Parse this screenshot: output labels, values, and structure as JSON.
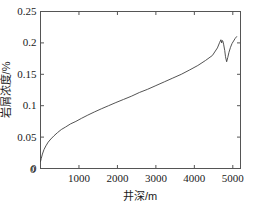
{
  "chart_data": {
    "type": "line",
    "title": "",
    "xlabel": "井深/m",
    "ylabel": "岩屑浓度/%",
    "xlim": [
      0,
      5200
    ],
    "ylim": [
      0,
      0.25
    ],
    "xticks": [
      0,
      1000,
      2000,
      3000,
      4000,
      5000
    ],
    "xtick_labels": [
      "0",
      "1000",
      "2000",
      "3000",
      "4000",
      "5000"
    ],
    "yticks": [
      0,
      0.05,
      0.1,
      0.15,
      0.2,
      0.25
    ],
    "ytick_labels": [
      "0",
      "0.05",
      "0.1",
      "0.15",
      "0.2",
      "0.25"
    ],
    "grid": false,
    "legend": null,
    "line_color": "#404040",
    "line_width": 0.9,
    "axes_color": "#555555",
    "background_color": "#ffffff",
    "tick_direction": "in",
    "series": [
      {
        "name": "岩屑浓度",
        "x": [
          0,
          20,
          50,
          90,
          140,
          200,
          270,
          350,
          440,
          540,
          650,
          780,
          920,
          1070,
          1230,
          1400,
          1580,
          1770,
          1960,
          2160,
          2360,
          2570,
          2780,
          3000,
          3220,
          3440,
          3660,
          3880,
          4090,
          4290,
          4470,
          4600,
          4660,
          4690,
          4710,
          4720,
          4740,
          4760,
          4790,
          4810,
          4840,
          4870,
          4900,
          4940,
          4980,
          5020,
          5060,
          5100
        ],
        "y": [
          0.011,
          0.016,
          0.023,
          0.03,
          0.036,
          0.042,
          0.047,
          0.052,
          0.057,
          0.062,
          0.066,
          0.071,
          0.075,
          0.08,
          0.085,
          0.09,
          0.095,
          0.1,
          0.105,
          0.11,
          0.115,
          0.121,
          0.126,
          0.132,
          0.138,
          0.144,
          0.15,
          0.157,
          0.164,
          0.172,
          0.18,
          0.192,
          0.201,
          0.205,
          0.2,
          0.204,
          0.203,
          0.198,
          0.188,
          0.178,
          0.17,
          0.177,
          0.185,
          0.193,
          0.199,
          0.203,
          0.207,
          0.21
        ]
      }
    ]
  }
}
